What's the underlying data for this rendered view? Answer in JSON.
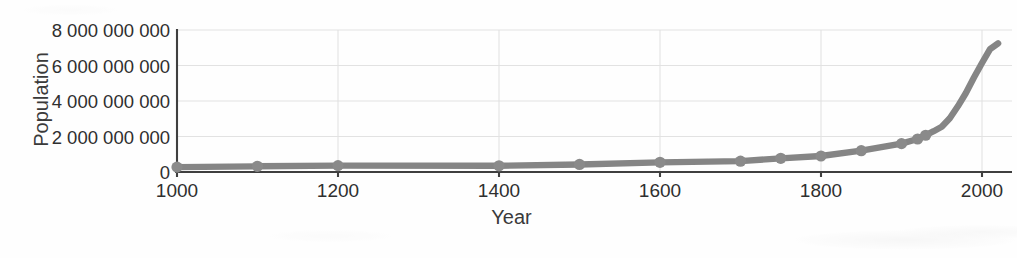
{
  "chart_data": {
    "type": "line",
    "title": "",
    "xlabel": "Year",
    "ylabel": "Population",
    "xlim": [
      1000,
      2030
    ],
    "ylim": [
      0,
      8000000000
    ],
    "grid": true,
    "legend": false,
    "line_color": "#858585",
    "marker_color": "#8a8a8a",
    "axis_color": "#3f3f3f",
    "gridline_color": "#e2e2e2",
    "x_ticks": [
      1000,
      1200,
      1400,
      1600,
      1800,
      2000
    ],
    "x_tick_labels": [
      "1000",
      "1200",
      "1400",
      "1600",
      "1800",
      "2000"
    ],
    "y_ticks": [
      0,
      2000000000,
      4000000000,
      6000000000,
      8000000000
    ],
    "y_tick_labels": [
      "0",
      "2 000 000 000",
      "4 000 000 000",
      "6 000 000 000",
      "8 000 000 000"
    ],
    "series": [
      {
        "name": "World population",
        "x": [
          1000,
          1100,
          1200,
          1400,
          1500,
          1600,
          1700,
          1750,
          1800,
          1850,
          1900,
          1920,
          1930,
          1940,
          1950,
          1960,
          1970,
          1980,
          1990,
          2000,
          2010,
          2020
        ],
        "y": [
          275000000,
          320000000,
          360000000,
          350000000,
          425000000,
          545000000,
          610000000,
          770000000,
          900000000,
          1200000000,
          1600000000,
          1860000000,
          2070000000,
          2300000000,
          2550000000,
          3030000000,
          3700000000,
          4450000000,
          5320000000,
          6140000000,
          6920000000,
          7250000000
        ]
      }
    ],
    "marker_x": [
      1000,
      1100,
      1200,
      1400,
      1500,
      1600,
      1700,
      1750,
      1800,
      1850,
      1900,
      1920,
      1930
    ]
  },
  "axis_labels": {
    "y_title": "Population",
    "x_title": "Year"
  }
}
